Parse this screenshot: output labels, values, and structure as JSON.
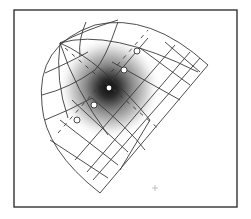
{
  "figure": {
    "type": "curvilinear-grid-diagram",
    "colors": {
      "frame": "#333333",
      "grid": "#3a3a3a",
      "spot_core": "#111111",
      "spot_edge": "#ffffff",
      "marker_fill": "#ffffff"
    },
    "frame": {
      "x": 14,
      "y": 10,
      "width": 223,
      "height": 197
    },
    "apex": {
      "x": 60,
      "y": 43
    },
    "bottom_tip": {
      "x": 100,
      "y": 193
    },
    "right_corner": {
      "x": 208,
      "y": 65
    },
    "center_point": {
      "x": 109,
      "y": 88
    },
    "markers": [
      {
        "x": 137,
        "y": 51
      },
      {
        "x": 124,
        "y": 70
      },
      {
        "x": 94,
        "y": 105
      },
      {
        "x": 77,
        "y": 120
      }
    ],
    "small_cross": {
      "x": 155,
      "y": 188
    }
  }
}
